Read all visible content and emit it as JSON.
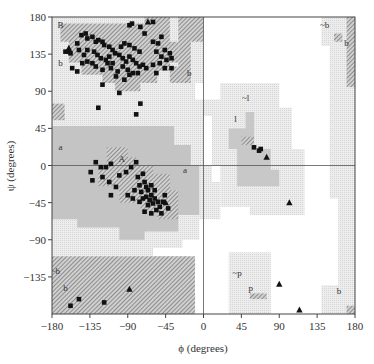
{
  "chart_data": {
    "type": "scatter",
    "title": "",
    "xlabel": "ϕ (degrees)",
    "ylabel": "ψ (degrees)",
    "xlim": [
      -180,
      180
    ],
    "ylim": [
      -180,
      180
    ],
    "xticks": [
      -180,
      -135,
      -90,
      -45,
      0,
      45,
      90,
      135,
      180
    ],
    "yticks": [
      -135,
      -90,
      -45,
      0,
      45,
      90,
      135,
      180
    ],
    "xtick_labels": [
      "−180",
      "−135",
      "−90",
      "−45",
      "0",
      "45",
      "90",
      "135",
      "180"
    ],
    "ytick_labels": [
      "−135",
      "−90",
      "−45",
      "0",
      "45",
      "90",
      "135",
      "180"
    ],
    "grid": false,
    "reference_lines": {
      "phi": 0,
      "psi": 0
    },
    "legend": "none",
    "colors": {
      "core": "#b8b8b8",
      "allowed": "#d8d8d8",
      "generous": "#ececec",
      "hatch": "#555555",
      "point": "#111111",
      "axis": "#444444"
    },
    "region_labels": [
      {
        "text": "B",
        "phi": -170,
        "psi": 170
      },
      {
        "text": "b",
        "phi": -170,
        "psi": 124
      },
      {
        "text": "a",
        "phi": -170,
        "psi": 22
      },
      {
        "text": "A",
        "phi": -97,
        "psi": 8
      },
      {
        "text": "a",
        "phi": -22,
        "psi": -6
      },
      {
        "text": "b",
        "phi": -17,
        "psi": 112
      },
      {
        "text": "~l",
        "phi": 50,
        "psi": 82
      },
      {
        "text": "l",
        "phi": 38,
        "psi": 56
      },
      {
        "text": "~b",
        "phi": 144,
        "psi": 170
      },
      {
        "text": "b",
        "phi": 170,
        "psi": 149
      },
      {
        "text": "~b",
        "phi": -176,
        "psi": -128
      },
      {
        "text": "b",
        "phi": -164,
        "psi": -148
      },
      {
        "text": "~p",
        "phi": 40,
        "psi": -130
      },
      {
        "text": "p",
        "phi": 56,
        "psi": -148
      },
      {
        "text": "b",
        "phi": 161,
        "psi": -152
      }
    ],
    "series": [
      {
        "name": "non-glycine residues",
        "marker": "square",
        "points": [
          [
            -85,
            172
          ],
          [
            -75,
            168
          ],
          [
            -60,
            174
          ],
          [
            -145,
            158
          ],
          [
            -140,
            160
          ],
          [
            -138,
            154
          ],
          [
            -132,
            156
          ],
          [
            -128,
            150
          ],
          [
            -125,
            152
          ],
          [
            -120,
            150
          ],
          [
            -118,
            146
          ],
          [
            -112,
            144
          ],
          [
            -108,
            140
          ],
          [
            -150,
            148
          ],
          [
            -160,
            138
          ],
          [
            -164,
            138
          ],
          [
            -158,
            136
          ],
          [
            -148,
            140
          ],
          [
            -142,
            134
          ],
          [
            -138,
            140
          ],
          [
            -130,
            138
          ],
          [
            -126,
            134
          ],
          [
            -122,
            130
          ],
          [
            -116,
            128
          ],
          [
            -112,
            132
          ],
          [
            -105,
            136
          ],
          [
            -100,
            134
          ],
          [
            -96,
            130
          ],
          [
            -92,
            126
          ],
          [
            -88,
            132
          ],
          [
            -84,
            128
          ],
          [
            -80,
            124
          ],
          [
            -76,
            120
          ],
          [
            -72,
            122
          ],
          [
            -68,
            118
          ],
          [
            -96,
            120
          ],
          [
            -90,
            116
          ],
          [
            -84,
            112
          ],
          [
            -102,
            114
          ],
          [
            -110,
            118
          ],
          [
            -104,
            108
          ],
          [
            -94,
            104
          ],
          [
            -88,
            110
          ],
          [
            -78,
            112
          ],
          [
            -132,
            124
          ],
          [
            -138,
            126
          ],
          [
            -144,
            124
          ],
          [
            -156,
            118
          ],
          [
            -150,
            114
          ],
          [
            -128,
            120
          ],
          [
            -120,
            116
          ],
          [
            -114,
            124
          ],
          [
            -108,
            124
          ],
          [
            -98,
            144
          ],
          [
            -94,
            148
          ],
          [
            -88,
            146
          ],
          [
            -82,
            142
          ],
          [
            -76,
            138
          ],
          [
            -60,
            150
          ],
          [
            -50,
            156
          ],
          [
            -54,
            148
          ],
          [
            -46,
            140
          ],
          [
            -40,
            136
          ],
          [
            -56,
            138
          ],
          [
            -50,
            132
          ],
          [
            -44,
            128
          ],
          [
            -38,
            130
          ],
          [
            -52,
            124
          ],
          [
            -46,
            118
          ],
          [
            -38,
            118
          ],
          [
            -56,
            112
          ],
          [
            -60,
            122
          ],
          [
            -120,
            98
          ],
          [
            -100,
            88
          ],
          [
            -125,
            70
          ],
          [
            -75,
            75
          ],
          [
            -80,
            62
          ],
          [
            -88,
            170
          ],
          [
            -70,
            160
          ],
          [
            -128,
            4
          ],
          [
            -122,
            -2
          ],
          [
            -116,
            -2
          ],
          [
            -110,
            2
          ],
          [
            -134,
            -8
          ],
          [
            -120,
            -14
          ],
          [
            -132,
            -18
          ],
          [
            -112,
            -20
          ],
          [
            -100,
            -12
          ],
          [
            -92,
            -8
          ],
          [
            -86,
            -2
          ],
          [
            -80,
            4
          ],
          [
            -78,
            -14
          ],
          [
            -72,
            -10
          ],
          [
            -70,
            -20
          ],
          [
            -68,
            -26
          ],
          [
            -76,
            -24
          ],
          [
            -82,
            -30
          ],
          [
            -74,
            -32
          ],
          [
            -66,
            -30
          ],
          [
            -62,
            -24
          ],
          [
            -58,
            -30
          ],
          [
            -62,
            -36
          ],
          [
            -68,
            -38
          ],
          [
            -72,
            -40
          ],
          [
            -64,
            -42
          ],
          [
            -58,
            -40
          ],
          [
            -54,
            -44
          ],
          [
            -60,
            -46
          ],
          [
            -52,
            -50
          ],
          [
            -48,
            -44
          ],
          [
            -66,
            -48
          ],
          [
            -56,
            -54
          ],
          [
            -46,
            -36
          ],
          [
            -76,
            -44
          ],
          [
            -90,
            -36
          ],
          [
            -84,
            -40
          ],
          [
            -104,
            -26
          ],
          [
            -110,
            -36
          ],
          [
            -50,
            -58
          ],
          [
            -42,
            -52
          ],
          [
            -70,
            -56
          ],
          [
            -62,
            -58
          ],
          [
            -148,
            -162
          ],
          [
            -158,
            -170
          ],
          [
            -118,
            -166
          ],
          [
            60,
            22
          ],
          [
            66,
            18
          ],
          [
            68,
            20
          ]
        ]
      },
      {
        "name": "glycine residues",
        "marker": "triangle",
        "points": [
          [
            -66,
            174
          ],
          [
            -160,
            142
          ],
          [
            -45,
            -45
          ],
          [
            75,
            10
          ],
          [
            102,
            -45
          ],
          [
            90,
            -144
          ],
          [
            114,
            -175
          ],
          [
            -88,
            -150
          ]
        ]
      }
    ]
  }
}
